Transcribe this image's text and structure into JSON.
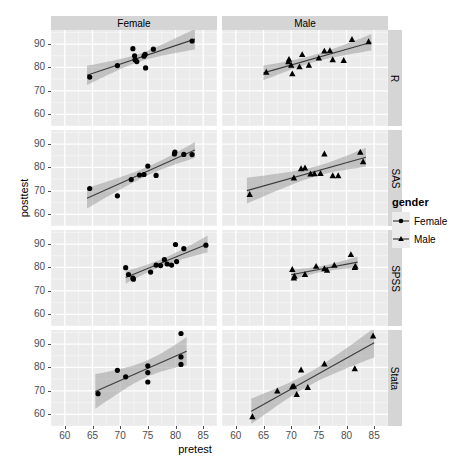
{
  "chart_data": {
    "type": "scatter",
    "title": "",
    "xlabel": "pretest",
    "ylabel": "posttest",
    "xlim": [
      57.5,
      87.5
    ],
    "ylim": [
      55,
      96
    ],
    "xticks": [
      60,
      65,
      70,
      75,
      80,
      85
    ],
    "yticks": [
      60,
      70,
      80,
      90
    ],
    "grid": true,
    "facet_cols": [
      "Female",
      "Male"
    ],
    "facet_rows": [
      "R",
      "SAS",
      "SPSS",
      "Stata"
    ],
    "legend": {
      "title": "gender",
      "position": "right",
      "entries": [
        {
          "name": "Female",
          "marker": "circle"
        },
        {
          "name": "Male",
          "marker": "triangle"
        }
      ]
    },
    "smooth": "lm with 95% confidence band",
    "panels": [
      {
        "row": "R",
        "col": "Female",
        "marker": "circle",
        "points": [
          [
            64.5,
            75.9
          ],
          [
            69.5,
            80.8
          ],
          [
            72.3,
            88.0
          ],
          [
            72.6,
            85.0
          ],
          [
            72.7,
            83.3
          ],
          [
            73.0,
            82.5
          ],
          [
            74.3,
            84.8
          ],
          [
            74.5,
            85.6
          ],
          [
            74.6,
            79.8
          ],
          [
            76.0,
            87.8
          ],
          [
            83.0,
            91.3
          ]
        ],
        "fit": {
          "x": [
            64.0,
            83.5
          ],
          "y": [
            77.5,
            90.0
          ]
        }
      },
      {
        "row": "R",
        "col": "Male",
        "marker": "triangle",
        "points": [
          [
            65.5,
            78.0
          ],
          [
            69.5,
            82.5
          ],
          [
            69.6,
            83.5
          ],
          [
            70.0,
            81.0
          ],
          [
            70.2,
            77.3
          ],
          [
            71.5,
            80.3
          ],
          [
            72.0,
            85.5
          ],
          [
            73.2,
            81.0
          ],
          [
            75.0,
            84.0
          ],
          [
            76.0,
            87.0
          ],
          [
            77.0,
            87.2
          ],
          [
            77.5,
            83.3
          ],
          [
            79.5,
            83.0
          ],
          [
            81.0,
            92.0
          ],
          [
            84.0,
            91.0
          ]
        ],
        "fit": {
          "x": [
            65.0,
            84.5
          ],
          "y": [
            78.8,
            90.5
          ]
        }
      },
      {
        "row": "SAS",
        "col": "Female",
        "marker": "circle",
        "points": [
          [
            64.5,
            71.0
          ],
          [
            69.5,
            67.9
          ],
          [
            72.0,
            74.8
          ],
          [
            73.5,
            76.8
          ],
          [
            74.3,
            77.0
          ],
          [
            75.0,
            80.6
          ],
          [
            76.5,
            76.6
          ],
          [
            79.8,
            85.8
          ],
          [
            79.9,
            86.5
          ],
          [
            81.5,
            85.6
          ],
          [
            83.0,
            85.5
          ]
        ],
        "fit": {
          "x": [
            64.0,
            83.5
          ],
          "y": [
            70.5,
            86.0
          ]
        }
      },
      {
        "row": "SAS",
        "col": "Male",
        "marker": "triangle",
        "points": [
          [
            62.5,
            68.5
          ],
          [
            70.5,
            75.5
          ],
          [
            71.8,
            79.5
          ],
          [
            72.5,
            79.8
          ],
          [
            73.5,
            77.2
          ],
          [
            74.2,
            77.3
          ],
          [
            75.3,
            77.5
          ],
          [
            76.0,
            85.8
          ],
          [
            77.5,
            76.5
          ],
          [
            78.5,
            76.5
          ],
          [
            82.5,
            86.5
          ],
          [
            83.0,
            82.5
          ]
        ],
        "fit": {
          "x": [
            62.0,
            83.5
          ],
          "y": [
            71.0,
            83.5
          ]
        }
      },
      {
        "row": "SPSS",
        "col": "Female",
        "marker": "circle",
        "points": [
          [
            71.0,
            79.9
          ],
          [
            71.5,
            77.0
          ],
          [
            72.3,
            75.5
          ],
          [
            72.4,
            75.0
          ],
          [
            75.5,
            78.0
          ],
          [
            76.5,
            81.0
          ],
          [
            77.3,
            80.8
          ],
          [
            78.0,
            83.3
          ],
          [
            78.5,
            81.5
          ],
          [
            79.3,
            81.0
          ],
          [
            80.0,
            89.8
          ],
          [
            80.2,
            82.5
          ],
          [
            81.5,
            88.0
          ],
          [
            85.5,
            89.5
          ]
        ],
        "fit": {
          "x": [
            71.0,
            85.8
          ],
          "y": [
            77.0,
            88.0
          ]
        }
      },
      {
        "row": "SPSS",
        "col": "Male",
        "marker": "triangle",
        "points": [
          [
            70.2,
            79.2
          ],
          [
            70.5,
            75.5
          ],
          [
            70.6,
            76.3
          ],
          [
            72.5,
            77.0
          ],
          [
            74.5,
            80.5
          ],
          [
            76.0,
            79.5
          ],
          [
            76.5,
            78.8
          ],
          [
            77.8,
            81.0
          ],
          [
            80.8,
            85.5
          ],
          [
            81.5,
            80.0
          ],
          [
            81.6,
            80.5
          ]
        ],
        "fit": {
          "x": [
            70.0,
            82.0
          ],
          "y": [
            77.5,
            81.0
          ]
        }
      },
      {
        "row": "Stata",
        "col": "Female",
        "marker": "circle",
        "points": [
          [
            66.0,
            68.8
          ],
          [
            69.5,
            78.8
          ],
          [
            71.0,
            76.0
          ],
          [
            75.0,
            80.7
          ],
          [
            75.0,
            77.8
          ],
          [
            75.0,
            73.8
          ],
          [
            81.0,
            94.5
          ],
          [
            81.0,
            84.5
          ],
          [
            81.0,
            81.3
          ]
        ],
        "fit": {
          "x": [
            65.5,
            82.0
          ],
          "y": [
            69.5,
            84.5
          ]
        }
      },
      {
        "row": "Stata",
        "col": "Male",
        "marker": "triangle",
        "points": [
          [
            63.0,
            59.0
          ],
          [
            67.5,
            70.0
          ],
          [
            70.2,
            71.8
          ],
          [
            70.5,
            72.0
          ],
          [
            71.0,
            68.5
          ],
          [
            71.8,
            79.0
          ],
          [
            73.0,
            71.5
          ],
          [
            76.0,
            81.5
          ],
          [
            81.5,
            79.5
          ],
          [
            84.8,
            93.5
          ]
        ],
        "fit": {
          "x": [
            62.8,
            85.0
          ],
          "y": [
            58.5,
            88.5
          ]
        }
      }
    ]
  },
  "axes": {
    "y_title": "posttest",
    "x_title": "pretest",
    "y_tick_labels": [
      "90",
      "80",
      "70",
      "60"
    ],
    "x_tick_labels": [
      "60",
      "65",
      "70",
      "75",
      "80",
      "85"
    ]
  },
  "strips": {
    "top": [
      "Female",
      "Male"
    ],
    "right": [
      "R",
      "SAS",
      "SPSS",
      "Stata"
    ]
  },
  "legend": {
    "title": "gender",
    "items": [
      {
        "label": "Female"
      },
      {
        "label": "Male"
      }
    ]
  },
  "colors": {
    "panel_bg": "#ebebeb",
    "strip_bg": "#d5d5d5",
    "grid_major": "#ffffff",
    "grid_minor": "#f5f5f5",
    "point": "#000000",
    "line": "#3c3c3c",
    "ribbon": "#9f9f9f",
    "tick_text": "#4d4d4d",
    "page_bg": "#ffffff"
  }
}
